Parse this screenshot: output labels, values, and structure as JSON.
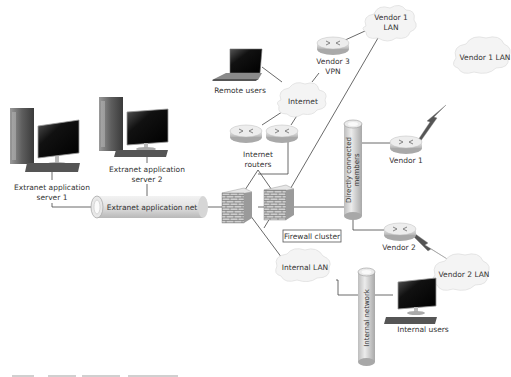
{
  "diagram": {
    "type": "network-topology",
    "nodes": {
      "vendor1_lan_top": {
        "label_line1": "Vendor 1",
        "label_line2": "LAN",
        "kind": "cloud"
      },
      "vendor3_vpn": {
        "label_line1": "Vendor 3",
        "label_line2": "VPN",
        "kind": "router"
      },
      "remote_users": {
        "label": "Remote users",
        "kind": "laptop"
      },
      "internet": {
        "label": "Internet",
        "kind": "cloud"
      },
      "internet_routers": {
        "label_line1": "Internet",
        "label_line2": "routers",
        "kind": "router-pair"
      },
      "vendor1_lan_right": {
        "label": "Vendor 1 LAN",
        "kind": "cloud"
      },
      "vendor1": {
        "label": "Vendor 1",
        "kind": "router"
      },
      "directly_connected_members": {
        "label_line1": "Directly connected",
        "label_line2": "members",
        "kind": "network-cylinder"
      },
      "extranet_server1": {
        "label_line1": "Extranet application",
        "label_line2": "server 1",
        "kind": "desktop-server"
      },
      "extranet_server2": {
        "label_line1": "Extranet application",
        "label_line2": "server 2",
        "kind": "desktop-server"
      },
      "extranet_app_net": {
        "label": "Extranet application net",
        "kind": "network-pipe"
      },
      "firewall_cluster": {
        "label": "Firewall cluster",
        "kind": "firewall-pair"
      },
      "vendor2": {
        "label": "Vendor 2",
        "kind": "router"
      },
      "vendor2_lan": {
        "label": "Vendor 2 LAN",
        "kind": "cloud"
      },
      "internal_lan": {
        "label": "Internal LAN",
        "kind": "cloud"
      },
      "internal_network": {
        "label": "Internal network",
        "kind": "network-cylinder"
      },
      "internal_users": {
        "label": "Internal users",
        "kind": "desktop"
      }
    },
    "links": [
      [
        "vendor3_vpn",
        "vendor1_lan_top"
      ],
      [
        "remote_users",
        "internet"
      ],
      [
        "vendor3_vpn",
        "internet"
      ],
      [
        "internet",
        "internet_routers"
      ],
      [
        "internet_routers",
        "firewall_cluster"
      ],
      [
        "vendor1_lan_top",
        "firewall_cluster"
      ],
      [
        "extranet_server1",
        "extranet_app_net"
      ],
      [
        "extranet_server2",
        "extranet_app_net"
      ],
      [
        "extranet_app_net",
        "firewall_cluster"
      ],
      [
        "firewall_cluster",
        "directly_connected_members"
      ],
      [
        "directly_connected_members",
        "vendor1"
      ],
      [
        "vendor1",
        "vendor1_lan_right",
        "wan"
      ],
      [
        "directly_connected_members",
        "vendor2"
      ],
      [
        "vendor2",
        "vendor2_lan",
        "wan"
      ],
      [
        "firewall_cluster",
        "internal_lan"
      ],
      [
        "internal_lan",
        "internal_network"
      ],
      [
        "internal_network",
        "internal_users"
      ]
    ],
    "colors": {
      "line": "#444444",
      "cloud_fill": "#f4f4f4",
      "device_gray": "#c8c8c8",
      "screen": "#1a1a1a"
    }
  }
}
